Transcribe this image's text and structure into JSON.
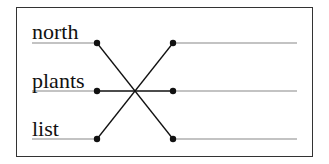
{
  "diagram": {
    "type": "matching-lines",
    "left_words": [
      "north",
      "plants",
      "list"
    ],
    "right_slots": [
      "",
      "",
      ""
    ],
    "connections": [
      {
        "from": "north",
        "to_row": 3
      },
      {
        "from": "plants",
        "to_row": 2
      },
      {
        "from": "list",
        "to_row": 1
      }
    ],
    "colors": {
      "line": "#111111",
      "answer_line": "#888888",
      "border": "#333333"
    }
  }
}
